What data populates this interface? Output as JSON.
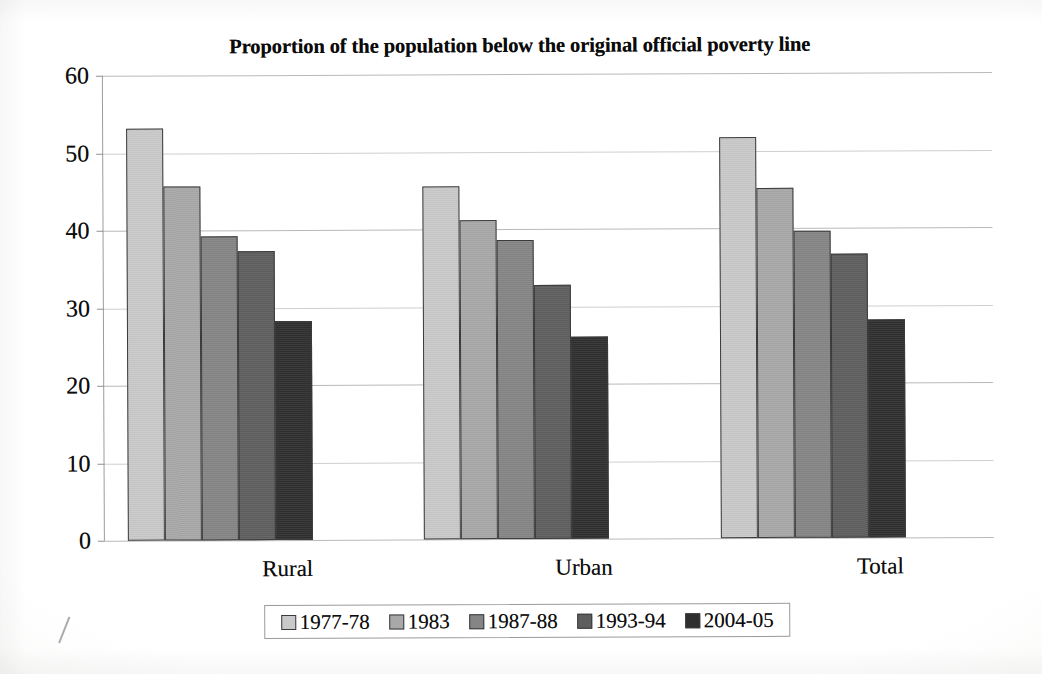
{
  "chart_data": {
    "type": "bar",
    "title": "Proportion of the population below the original official poverty line",
    "xlabel": "",
    "ylabel": "",
    "categories": [
      "Rural",
      "Urban",
      "Total"
    ],
    "series": [
      {
        "name": "1977-78",
        "color": "#c9c9c9",
        "values": [
          53.1,
          45.6,
          51.8
        ]
      },
      {
        "name": "1983",
        "color": "#a8a8a8",
        "values": [
          45.7,
          41.1,
          45.2
        ]
      },
      {
        "name": "1987-88",
        "color": "#858585",
        "values": [
          39.2,
          38.6,
          39.6
        ]
      },
      {
        "name": "1993-94",
        "color": "#5e5e5e",
        "values": [
          37.3,
          32.8,
          36.6
        ]
      },
      {
        "name": "2004-05",
        "color": "#2f2f2f",
        "values": [
          28.3,
          26.1,
          28.1
        ]
      }
    ],
    "ylim": [
      0,
      60
    ],
    "yticks": [
      0,
      10,
      20,
      30,
      40,
      50,
      60
    ],
    "ytick_labels": [
      "0",
      "10",
      "20",
      "30",
      "40",
      "50",
      "60"
    ],
    "grid": true,
    "legend_position": "bottom"
  },
  "artifacts": {
    "bleed_text_top": "scanned page bleed",
    "bleed_text_mid": "scanned page bleed"
  }
}
